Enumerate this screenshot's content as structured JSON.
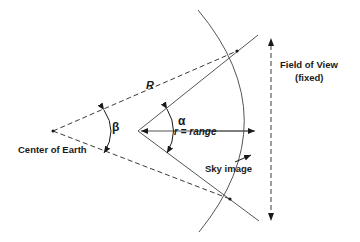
{
  "diagram": {
    "labels": {
      "radius": "R",
      "beta": "β",
      "alpha": "α",
      "range_r": "r",
      "range_eq": " = ",
      "range_word": "range",
      "center": "Center of Earth",
      "sky_image": "Sky image",
      "fov_line1": "Field of View",
      "fov_line2": "(fixed)"
    },
    "colors": {
      "line": "#3a3a3a",
      "text": "#1a1a1a",
      "background": "#ffffff"
    }
  }
}
